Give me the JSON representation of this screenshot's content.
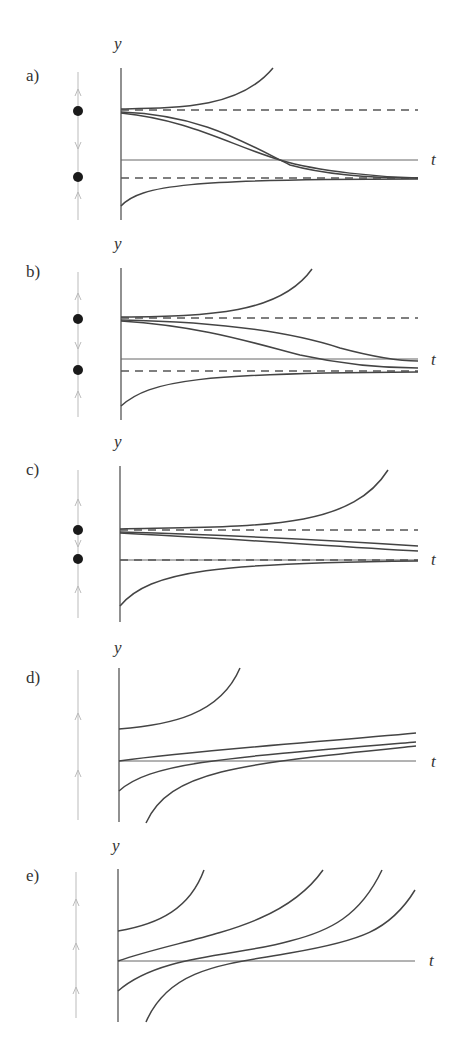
{
  "figure": {
    "panels": [
      {
        "id": "a",
        "label": "a)",
        "y_axis_label": "y",
        "t_axis_label": "t",
        "phase_line": {
          "equilibria": 2,
          "arrows": [
            "up",
            "down",
            "up"
          ]
        },
        "description": "Two equilibria (dashed); upper unstable, lower stable; solutions from near upper equilibrium decay to lower."
      },
      {
        "id": "b",
        "label": "b)",
        "y_axis_label": "y",
        "t_axis_label": "t",
        "phase_line": {
          "equilibria": 2,
          "arrows": [
            "up",
            "down",
            "up"
          ]
        },
        "description": "Two equilibria closer together; similar behavior with slower decay."
      },
      {
        "id": "c",
        "label": "c)",
        "y_axis_label": "y",
        "t_axis_label": "t",
        "phase_line": {
          "equilibria": 2,
          "arrows": [
            "up",
            "down",
            "up"
          ]
        },
        "description": "Equilibria very close; lower equilibrium on t-axis."
      },
      {
        "id": "d",
        "label": "d)",
        "y_axis_label": "y",
        "t_axis_label": "t",
        "phase_line": {
          "equilibria": 0,
          "arrows": [
            "up",
            "up"
          ]
        },
        "description": "No equilibria; all solutions increase."
      },
      {
        "id": "e",
        "label": "e)",
        "y_axis_label": "y",
        "t_axis_label": "t",
        "phase_line": {
          "equilibria": 0,
          "arrows": [
            "up",
            "up",
            "up"
          ]
        },
        "description": "No equilibria; solutions increase and blow up."
      }
    ]
  },
  "colors": {
    "curve": "#444444",
    "axis": "#555555",
    "phase": "#bbbbbb",
    "dot": "#1a1a1a"
  }
}
